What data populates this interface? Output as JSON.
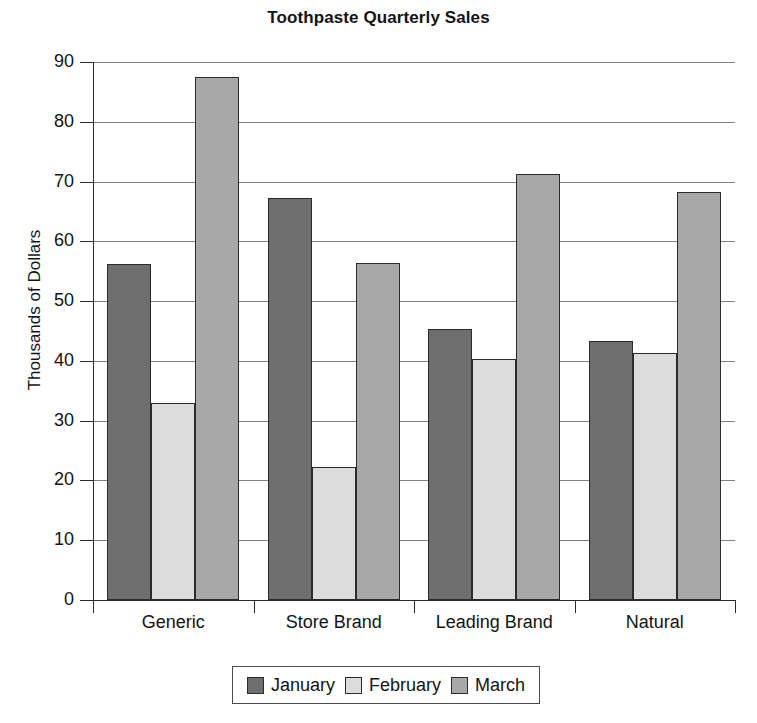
{
  "chart_data": {
    "type": "bar",
    "title": "Toothpaste Quarterly Sales",
    "xlabel": "",
    "ylabel": "Thousands of Dollars",
    "categories": [
      "Generic",
      "Store Brand",
      "Leading Brand",
      "Natural"
    ],
    "series": [
      {
        "name": "January",
        "color": "#6e6e6e",
        "values": [
          56.2,
          67.3,
          45.4,
          43.3
        ]
      },
      {
        "name": "February",
        "color": "#dcdcdc",
        "values": [
          33.0,
          22.3,
          40.3,
          41.3
        ]
      },
      {
        "name": "March",
        "color": "#a8a8a8",
        "values": [
          87.5,
          56.3,
          71.3,
          68.3
        ]
      }
    ],
    "ylim": [
      0,
      90
    ],
    "yticks": [
      0,
      10,
      20,
      30,
      40,
      50,
      60,
      70,
      80,
      90
    ],
    "ytick_labels": [
      "0",
      "10",
      "20",
      "30",
      "40",
      "50",
      "60",
      "70",
      "80",
      "90"
    ],
    "grid": true,
    "legend_position": "bottom"
  },
  "legend": {
    "items": [
      {
        "label": "January",
        "color": "#6e6e6e"
      },
      {
        "label": "February",
        "color": "#dcdcdc"
      },
      {
        "label": "March",
        "color": "#a8a8a8"
      }
    ]
  }
}
